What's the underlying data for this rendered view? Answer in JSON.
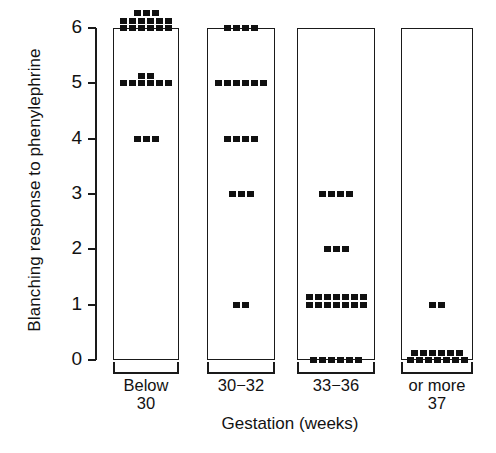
{
  "chart_data": {
    "type": "scatter",
    "title": "",
    "subtitle": "",
    "xlabel": "Gestation  (weeks)",
    "ylabel": "Blanching response to phenylephrine",
    "ylim": [
      0,
      6
    ],
    "yticks": [
      "0",
      "1",
      "2",
      "3",
      "4",
      "5",
      "6"
    ],
    "grid": false,
    "legend": "none",
    "categories": [
      "Below 30",
      "30-32",
      "33-36",
      "37 or more"
    ],
    "groups": [
      {
        "label_line1": "Below",
        "label_line2": "30",
        "counts_by_response": {
          "0": 0,
          "1": 0,
          "2": 0,
          "3": 0,
          "4": 3,
          "5": 8,
          "6": 15
        },
        "total": 26
      },
      {
        "label_line1": "30−32",
        "label_line2": "",
        "counts_by_response": {
          "0": 0,
          "1": 2,
          "2": 0,
          "3": 3,
          "4": 4,
          "5": 6,
          "6": 4
        },
        "total": 19
      },
      {
        "label_line1": "33−36",
        "label_line2": "",
        "counts_by_response": {
          "0": 6,
          "1": 14,
          "2": 3,
          "3": 4,
          "4": 0,
          "5": 0,
          "6": 0
        },
        "total": 27
      },
      {
        "label_line1": "or more",
        "label_line2": "37",
        "counts_by_response": {
          "0": 13,
          "1": 2,
          "2": 0,
          "3": 0,
          "4": 0,
          "5": 0,
          "6": 0
        },
        "total": 15
      }
    ],
    "colors": {
      "dot": "#111111",
      "axis": "#1a1a1a",
      "background": "#ffffff",
      "text": "#121212"
    }
  }
}
